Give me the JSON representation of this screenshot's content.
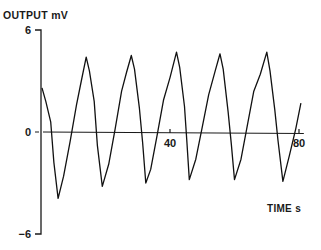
{
  "chart_data": {
    "type": "line",
    "title": "",
    "ylabel": "OUTPUT mV",
    "xlabel": "TIME s",
    "ylim": [
      -6,
      6
    ],
    "xlim": [
      0,
      82
    ],
    "y_ticks": [
      {
        "value": 6,
        "label": "6"
      },
      {
        "value": 0,
        "label": "0"
      },
      {
        "value": -6,
        "label": "−6"
      }
    ],
    "x_ticks": [
      {
        "value": 40,
        "label": "40"
      },
      {
        "value": 80,
        "label": "80"
      }
    ],
    "grid": false,
    "legend": null,
    "zero_line": true,
    "series": [
      {
        "name": "output",
        "x": [
          0.3,
          1.5,
          3.0,
          4.0,
          5.3,
          7.0,
          9.0,
          11.0,
          12.5,
          14.0,
          15.0,
          16.5,
          17.5,
          19.0,
          21.0,
          23.0,
          25.0,
          26.5,
          28.0,
          29.0,
          30.5,
          31.5,
          32.5,
          34.0,
          36.0,
          38.0,
          40.0,
          42.0,
          43.0,
          44.5,
          45.2,
          46.0,
          48.0,
          50.0,
          52.0,
          54.0,
          55.5,
          56.5,
          58.0,
          59.0,
          60.0,
          62.0,
          64.0,
          66.0,
          68.0,
          70.0,
          71.0,
          72.5,
          73.5,
          75.0,
          77.0,
          79.0,
          80.6
        ],
        "y": [
          2.6,
          1.8,
          0.6,
          -1.8,
          -3.9,
          -2.6,
          -0.6,
          1.6,
          3.0,
          4.4,
          3.6,
          1.8,
          -0.8,
          -3.2,
          -1.9,
          0.2,
          2.4,
          3.5,
          4.5,
          3.7,
          1.4,
          -0.6,
          -3.0,
          -2.2,
          -0.2,
          1.9,
          3.2,
          4.7,
          3.8,
          1.5,
          -0.5,
          -2.8,
          -1.6,
          0.3,
          2.2,
          3.6,
          4.6,
          3.7,
          1.2,
          -0.7,
          -2.8,
          -1.6,
          0.4,
          2.4,
          3.4,
          4.7,
          3.6,
          1.3,
          -0.5,
          -2.9,
          -1.4,
          0.2,
          1.7
        ]
      }
    ]
  }
}
